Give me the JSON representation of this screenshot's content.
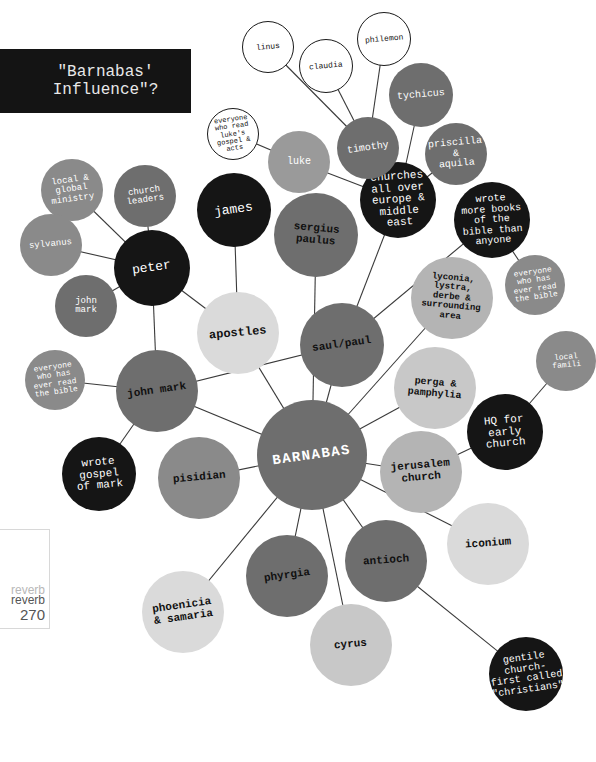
{
  "title": "\"Barnabas'\nInfluence\"?",
  "page_marker": {
    "brand_faint": "reverb",
    "brand": "reverb",
    "page_number": "270"
  },
  "colors": {
    "black": "#151515",
    "dark_gray": "#6b6b6b",
    "mid_gray": "#8a8a8a",
    "light_gray": "#c8c8c8",
    "pale_gray": "#dcdcdc",
    "outline": "#ffffff",
    "line": "#3a3a3a"
  },
  "nodes": [
    {
      "id": "barnabas",
      "label": "BARNABAS",
      "x": 312,
      "y": 455,
      "r": 55,
      "fill": "#6e6e6e",
      "text": "#ffffff",
      "fs": 14,
      "bold": true,
      "rot": -8
    },
    {
      "id": "saul_paul",
      "label": "saul/paul",
      "x": 342,
      "y": 345,
      "r": 42,
      "fill": "#6e6e6e",
      "text": "#111111",
      "fs": 11,
      "bold": true,
      "rot": -8
    },
    {
      "id": "john_mark_main",
      "label": "john mark",
      "x": 157,
      "y": 391,
      "r": 41,
      "fill": "#6e6e6e",
      "text": "#111111",
      "fs": 11,
      "bold": true,
      "rot": -8
    },
    {
      "id": "apostles",
      "label": "apostles",
      "x": 238,
      "y": 333,
      "r": 41,
      "fill": "#dadada",
      "text": "#111111",
      "fs": 12,
      "bold": true,
      "rot": -5
    },
    {
      "id": "peter",
      "label": "peter",
      "x": 152,
      "y": 268,
      "r": 38,
      "fill": "#151515",
      "text": "#ffffff",
      "fs": 13,
      "bold": false,
      "rot": -8
    },
    {
      "id": "james",
      "label": "james",
      "x": 234,
      "y": 210,
      "r": 37,
      "fill": "#151515",
      "text": "#ffffff",
      "fs": 13,
      "bold": false,
      "rot": -8
    },
    {
      "id": "sergius_paulus",
      "label": "sergius\npaulus",
      "x": 316,
      "y": 235,
      "r": 42,
      "fill": "#6e6e6e",
      "text": "#111111",
      "fs": 11,
      "bold": true,
      "rot": 5
    },
    {
      "id": "churches",
      "label": "churches\nall over\neurope &\nmiddle\neast",
      "x": 398,
      "y": 200,
      "r": 38,
      "fill": "#151515",
      "text": "#ffffff",
      "fs": 11,
      "bold": false,
      "rot": -4
    },
    {
      "id": "wrote_more",
      "label": "wrote\nmore books\nof the\nbible than\nanyone",
      "x": 492,
      "y": 220,
      "r": 38,
      "fill": "#151515",
      "text": "#ffffff",
      "fs": 10,
      "bold": false,
      "rot": -4
    },
    {
      "id": "timothy",
      "label": "timothy",
      "x": 368,
      "y": 148,
      "r": 31,
      "fill": "#6e6e6e",
      "text": "#ffffff",
      "fs": 10,
      "bold": false,
      "rot": -8
    },
    {
      "id": "luke",
      "label": "luke",
      "x": 299,
      "y": 162,
      "r": 31,
      "fill": "#9a9a9a",
      "text": "#ffffff",
      "fs": 10,
      "bold": false,
      "rot": 0
    },
    {
      "id": "tychicus",
      "label": "tychicus",
      "x": 421,
      "y": 95,
      "r": 32,
      "fill": "#6e6e6e",
      "text": "#ffffff",
      "fs": 10,
      "bold": false,
      "rot": -5
    },
    {
      "id": "priscilla_aquila",
      "label": "priscilla\n&\naquila",
      "x": 456,
      "y": 154,
      "r": 31,
      "fill": "#6e6e6e",
      "text": "#ffffff",
      "fs": 10,
      "bold": false,
      "rot": -5
    },
    {
      "id": "linus",
      "label": "linus",
      "x": 268,
      "y": 47,
      "r": 26,
      "fill": "#ffffff",
      "text": "#111111",
      "fs": 8,
      "bold": false,
      "rot": -5,
      "outline": true
    },
    {
      "id": "claudia",
      "label": "claudia",
      "x": 326,
      "y": 66,
      "r": 27,
      "fill": "#ffffff",
      "text": "#111111",
      "fs": 8,
      "bold": false,
      "rot": -5,
      "outline": true
    },
    {
      "id": "philemon",
      "label": "philemon",
      "x": 384,
      "y": 39,
      "r": 27,
      "fill": "#ffffff",
      "text": "#111111",
      "fs": 8,
      "bold": false,
      "rot": -5,
      "outline": true
    },
    {
      "id": "everyone_luke",
      "label": "everyone\nwho read\nluke's\ngospel &\nacts",
      "x": 233,
      "y": 134,
      "r": 26,
      "fill": "#ffffff",
      "text": "#111111",
      "fs": 7,
      "bold": false,
      "rot": -8,
      "outline": true
    },
    {
      "id": "local_global",
      "label": "local &\nglobal\nministry",
      "x": 72,
      "y": 190,
      "r": 31,
      "fill": "#8a8a8a",
      "text": "#ffffff",
      "fs": 9,
      "bold": false,
      "rot": -8
    },
    {
      "id": "church_leaders",
      "label": "church\nleaders",
      "x": 145,
      "y": 196,
      "r": 31,
      "fill": "#6e6e6e",
      "text": "#ffffff",
      "fs": 9,
      "bold": false,
      "rot": -8
    },
    {
      "id": "sylvanus",
      "label": "sylvanus",
      "x": 51,
      "y": 245,
      "r": 31,
      "fill": "#8a8a8a",
      "text": "#ffffff",
      "fs": 9,
      "bold": false,
      "rot": -5
    },
    {
      "id": "john_mark_small",
      "label": "john\nmark",
      "x": 86,
      "y": 306,
      "r": 31,
      "fill": "#6e6e6e",
      "text": "#ffffff",
      "fs": 9,
      "bold": false,
      "rot": 0
    },
    {
      "id": "everyone_bible_left",
      "label": "everyone\nwho has\never read\nthe bible",
      "x": 55,
      "y": 380,
      "r": 30,
      "fill": "#8a8a8a",
      "text": "#ffffff",
      "fs": 8,
      "bold": false,
      "rot": -8
    },
    {
      "id": "wrote_gospel_mark",
      "label": "wrote\ngospel\nof mark",
      "x": 99,
      "y": 474,
      "r": 37,
      "fill": "#151515",
      "text": "#ffffff",
      "fs": 11,
      "bold": false,
      "rot": -5
    },
    {
      "id": "pisidian",
      "label": "pisidian",
      "x": 199,
      "y": 478,
      "r": 41,
      "fill": "#8a8a8a",
      "text": "#111111",
      "fs": 11,
      "bold": true,
      "rot": -5
    },
    {
      "id": "lyconia",
      "label": "lyconia,\nlystra,\nderbe &\nsurrounding\narea",
      "x": 452,
      "y": 298,
      "r": 41,
      "fill": "#b4b4b4",
      "text": "#111111",
      "fs": 9,
      "bold": true,
      "rot": 5
    },
    {
      "id": "everyone_bible_right",
      "label": "everyone\nwho has\never read\nthe bible",
      "x": 535,
      "y": 285,
      "r": 30,
      "fill": "#8a8a8a",
      "text": "#ffffff",
      "fs": 8,
      "bold": false,
      "rot": -8
    },
    {
      "id": "local_families",
      "label": "local\nfamili",
      "x": 566,
      "y": 361,
      "r": 30,
      "fill": "#8a8a8a",
      "text": "#ffffff",
      "fs": 8,
      "bold": false,
      "rot": -5
    },
    {
      "id": "perga",
      "label": "perga &\npamphylia",
      "x": 435,
      "y": 388,
      "r": 41,
      "fill": "#c8c8c8",
      "text": "#111111",
      "fs": 10,
      "bold": true,
      "rot": 5
    },
    {
      "id": "hq_early_church",
      "label": "HQ for\nearly\nchurch",
      "x": 505,
      "y": 432,
      "r": 38,
      "fill": "#151515",
      "text": "#ffffff",
      "fs": 11,
      "bold": false,
      "rot": -5
    },
    {
      "id": "jerusalem_church",
      "label": "jerusalem\nchurch",
      "x": 421,
      "y": 472,
      "r": 41,
      "fill": "#b4b4b4",
      "text": "#111111",
      "fs": 11,
      "bold": true,
      "rot": -5
    },
    {
      "id": "iconium",
      "label": "iconium",
      "x": 488,
      "y": 544,
      "r": 41,
      "fill": "#dadada",
      "text": "#111111",
      "fs": 11,
      "bold": true,
      "rot": -4
    },
    {
      "id": "antioch",
      "label": "antioch",
      "x": 386,
      "y": 561,
      "r": 41,
      "fill": "#6e6e6e",
      "text": "#111111",
      "fs": 11,
      "bold": true,
      "rot": -4
    },
    {
      "id": "phyrgia",
      "label": "phyrgia",
      "x": 287,
      "y": 576,
      "r": 41,
      "fill": "#6e6e6e",
      "text": "#111111",
      "fs": 11,
      "bold": true,
      "rot": -8
    },
    {
      "id": "cyrus",
      "label": "cyrus",
      "x": 351,
      "y": 645,
      "r": 41,
      "fill": "#c8c8c8",
      "text": "#111111",
      "fs": 11,
      "bold": true,
      "rot": -5
    },
    {
      "id": "phoenicia",
      "label": "phoenicia\n& samaria",
      "x": 183,
      "y": 612,
      "r": 41,
      "fill": "#dadada",
      "text": "#111111",
      "fs": 11,
      "bold": true,
      "rot": -8
    },
    {
      "id": "gentile_church",
      "label": "gentile\nchurch-\nfirst called\n\"christians\"",
      "x": 526,
      "y": 674,
      "r": 37,
      "fill": "#151515",
      "text": "#ffffff",
      "fs": 10,
      "bold": false,
      "rot": -8
    }
  ],
  "edges": [
    [
      "barnabas",
      "saul_paul"
    ],
    [
      "barnabas",
      "john_mark_main"
    ],
    [
      "barnabas",
      "apostles"
    ],
    [
      "barnabas",
      "sergius_paulus"
    ],
    [
      "barnabas",
      "lyconia"
    ],
    [
      "barnabas",
      "perga"
    ],
    [
      "barnabas",
      "jerusalem_church"
    ],
    [
      "barnabas",
      "iconium"
    ],
    [
      "barnabas",
      "antioch"
    ],
    [
      "barnabas",
      "cyrus"
    ],
    [
      "barnabas",
      "phyrgia"
    ],
    [
      "barnabas",
      "phoenicia"
    ],
    [
      "barnabas",
      "pisidian"
    ],
    [
      "saul_paul",
      "churches"
    ],
    [
      "saul_paul",
      "wrote_more"
    ],
    [
      "saul_paul",
      "john_mark_main"
    ],
    [
      "churches",
      "timothy"
    ],
    [
      "churches",
      "luke"
    ],
    [
      "churches",
      "tychicus"
    ],
    [
      "churches",
      "priscilla_aquila"
    ],
    [
      "timothy",
      "linus"
    ],
    [
      "timothy",
      "claudia"
    ],
    [
      "timothy",
      "philemon"
    ],
    [
      "luke",
      "everyone_luke"
    ],
    [
      "wrote_more",
      "everyone_bible_right"
    ],
    [
      "apostles",
      "james"
    ],
    [
      "apostles",
      "peter"
    ],
    [
      "peter",
      "local_global"
    ],
    [
      "peter",
      "church_leaders"
    ],
    [
      "peter",
      "sylvanus"
    ],
    [
      "peter",
      "john_mark_small"
    ],
    [
      "peter",
      "john_mark_main"
    ],
    [
      "john_mark_main",
      "everyone_bible_left"
    ],
    [
      "john_mark_main",
      "wrote_gospel_mark"
    ],
    [
      "jerusalem_church",
      "hq_early_church"
    ],
    [
      "hq_early_church",
      "local_families"
    ],
    [
      "antioch",
      "gentile_church"
    ]
  ]
}
